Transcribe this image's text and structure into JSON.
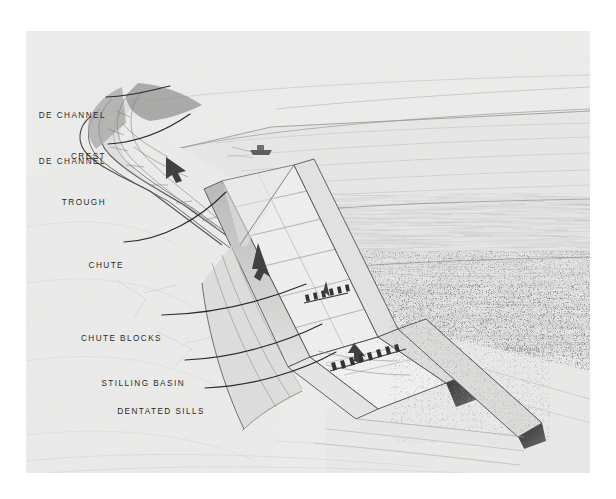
{
  "plate": {
    "kind": "perspective-illustration",
    "subject": "Side channel spillway with chute, chute blocks, stilling basin and dentated sills",
    "medium": "pencil rendering on paper (scanned plate)",
    "paper_color": "#ececeb",
    "ink_color": "#2a2a2a",
    "page_background": "#ffffff",
    "signature": "R.E.Nelson"
  },
  "callouts": [
    {
      "id": "side-channel-crest",
      "line1": "DE CHANNEL",
      "line2": "CREST",
      "leader_from": [
        106,
        97
      ],
      "leader_to": [
        168,
        86
      ]
    },
    {
      "id": "side-channel-trough",
      "line1": "DE CHANNEL",
      "line2": "TROUGH",
      "leader_from": [
        108,
        144
      ],
      "leader_to": [
        186,
        116
      ]
    },
    {
      "id": "chute",
      "line1": "CHUTE",
      "line2": "",
      "leader_from": [
        124,
        242
      ],
      "leader_to": [
        218,
        198
      ]
    },
    {
      "id": "chute-blocks",
      "line1": "CHUTE BLOCKS",
      "line2": "",
      "leader_from": [
        162,
        315
      ],
      "leader_to": [
        301,
        287
      ]
    },
    {
      "id": "stilling-basin",
      "line1": "STILLING BASIN",
      "line2": "",
      "leader_from": [
        185,
        360
      ],
      "leader_to": [
        318,
        327
      ]
    },
    {
      "id": "dentated-sills",
      "line1": "DENTATED SILLS",
      "line2": "",
      "leader_from": [
        205,
        388
      ],
      "leader_to": [
        330,
        355
      ]
    }
  ],
  "scene_elements": {
    "reservoir_label": "reservoir water surface",
    "boat_label": "small boat on reservoir",
    "embankment_label": "earth embankment dam",
    "downstream_channel_label": "downstream outlet channel",
    "brush_label": "stippled brush / vegetation slope",
    "flow_arrow_label": "water flow direction arrow"
  }
}
